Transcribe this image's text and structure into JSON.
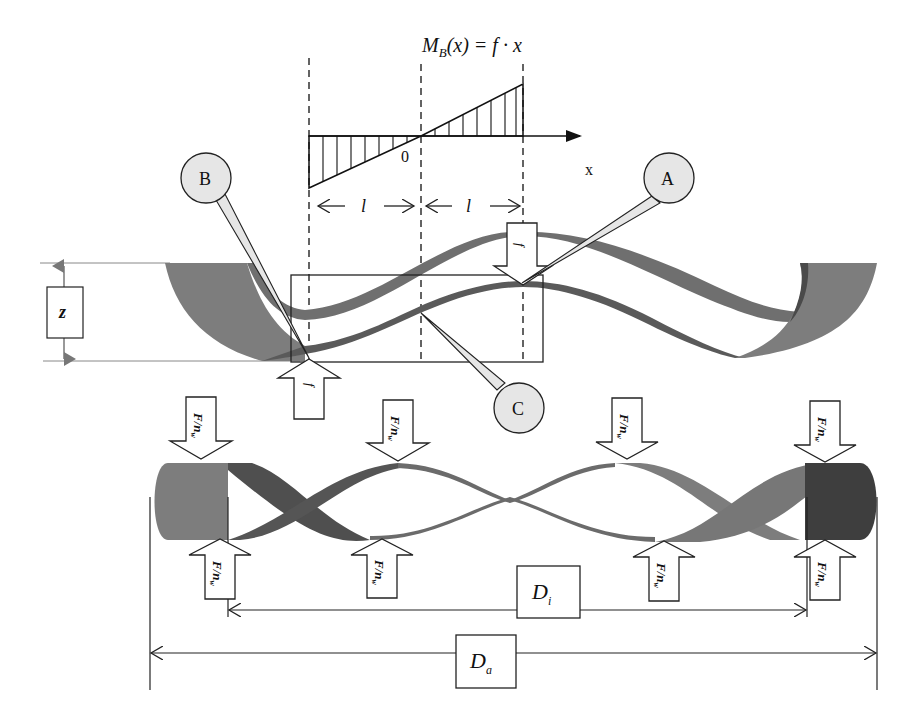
{
  "moment_diagram": {
    "formula_main": "M",
    "formula_sub": "B",
    "formula_rest": "(x) = f · x",
    "origin_label": "0",
    "axis_label": "x",
    "span_left_label": "l",
    "span_right_label": "l"
  },
  "callouts": {
    "a": "A",
    "b": "B",
    "c": "C"
  },
  "spring_top": {
    "height_label": "z",
    "force_top_label": "f",
    "force_bottom_label": "f"
  },
  "spring_bottom": {
    "force_label_main": "F",
    "force_label_sub": "w",
    "force_label_n": "n",
    "inner_diameter_main": "D",
    "inner_diameter_sub": "i",
    "outer_diameter_main": "D",
    "outer_diameter_sub": "a"
  },
  "colors": {
    "band_light": "#7d7d7d",
    "band_dark": "#555555",
    "band_darkest": "#3e3e3e",
    "callout_fill": "#e6e6e6",
    "line": "#222222",
    "guide": "#888888"
  }
}
